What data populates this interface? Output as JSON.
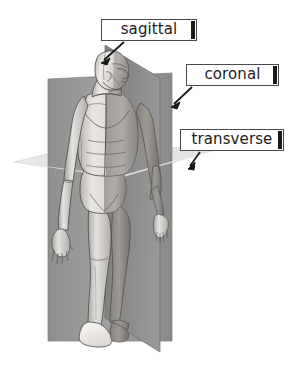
{
  "diagram": {
    "background_color": "#ffffff"
  },
  "labels": {
    "sagittal": "sagittal",
    "coronal": "coronal",
    "transverse": "transverse"
  },
  "planes": [
    {
      "id": "sagittal",
      "label": "sagittal",
      "orientation": "vertical-midline",
      "fill": "#8e8e8e",
      "description": "divides body into left and right halves"
    },
    {
      "id": "coronal",
      "label": "coronal",
      "orientation": "vertical-frontal",
      "fill": "#9a9a9a",
      "description": "divides body into front and back"
    },
    {
      "id": "transverse",
      "label": "transverse",
      "orientation": "horizontal",
      "fill": "#d8d8d8",
      "description": "divides body into upper and lower"
    }
  ],
  "arrows": [
    {
      "id": "arrow-sagittal",
      "from_label": "sagittal",
      "points_to": "sagittal-plane"
    },
    {
      "id": "arrow-coronal",
      "from_label": "coronal",
      "points_to": "coronal-plane"
    },
    {
      "id": "arrow-transverse",
      "from_label": "transverse",
      "points_to": "transverse-plane"
    }
  ],
  "figure": {
    "name": "anatomical-male-figure",
    "pose": "standing",
    "skin_light": "#e8e6e2",
    "skin_mid": "#c2bfba",
    "skin_shadow": "#8d8a86",
    "outline": "#3a3a3a"
  }
}
